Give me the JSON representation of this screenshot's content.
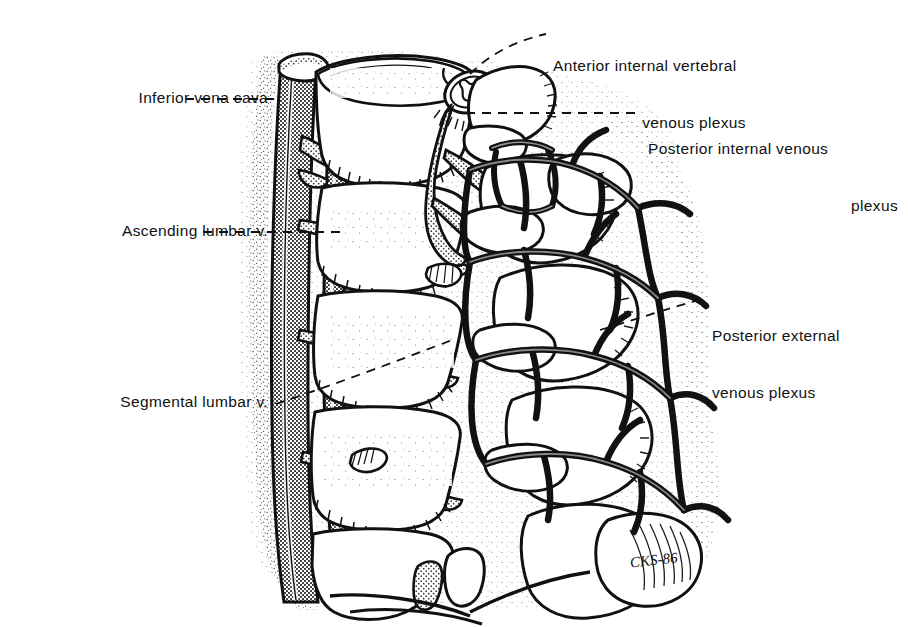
{
  "figure": {
    "artist_signature": "CKS-86",
    "style": "pen-and-ink medical illustration, stippled shading, halftone-gray vessels",
    "colors": {
      "ink": "#111111",
      "paper": "#ffffff",
      "vessel_gray": "#8d8d8d",
      "vessel_gray_light": "#b5b5b5",
      "stipple": "#2a2a2a"
    }
  },
  "labels": [
    {
      "id": "inferior-vena-cava",
      "lines": [
        "Inferior vena cava"
      ],
      "align": "right",
      "x": 28,
      "y": 88,
      "width": 240,
      "leader": "dashed-horizontal"
    },
    {
      "id": "ascending-lumbar-vein",
      "lines": [
        "Ascending lumbar v."
      ],
      "align": "right",
      "x": 28,
      "y": 221,
      "width": 240,
      "leader": "dashed-horizontal"
    },
    {
      "id": "segmental-lumbar-vein",
      "lines": [
        "Segmental lumbar v."
      ],
      "align": "right",
      "x": 18,
      "y": 392,
      "width": 250,
      "leader": "dashed-diagonal"
    },
    {
      "id": "anterior-internal-vertebral-venous-plexus",
      "lines": [
        "Anterior internal vertebral",
        "venous plexus"
      ],
      "align": "left",
      "x": 553,
      "y": 18,
      "width": 330,
      "leader": "dashed-elbow"
    },
    {
      "id": "posterior-internal-venous-plexus",
      "lines": [
        "Posterior internal venous",
        "plexus"
      ],
      "align": "left",
      "x": 648,
      "y": 101,
      "width": 258,
      "leader": "dashed-horizontal"
    },
    {
      "id": "posterior-external-venous-plexus",
      "lines": [
        "Posterior external",
        "venous plexus"
      ],
      "align": "left",
      "x": 712,
      "y": 288,
      "width": 196,
      "leader": "dashed-diagonal"
    }
  ],
  "anatomy_parts": [
    "inferior-vena-cava",
    "ascending-lumbar-vein",
    "segmental-lumbar-veins",
    "lumbar-vertebral-bodies",
    "spinal-cord-cross-section",
    "anterior-internal-vertebral-venous-plexus",
    "posterior-internal-venous-plexus",
    "posterior-external-venous-plexus",
    "transverse-processes",
    "spinous-processes",
    "intervertebral-discs"
  ]
}
